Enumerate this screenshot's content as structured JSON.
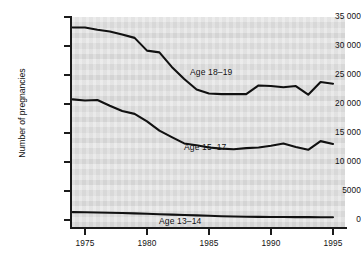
{
  "chart_data": {
    "type": "line",
    "title": "",
    "xlabel": "",
    "ylabel": "Number of pregnancies",
    "xlim": [
      1974,
      1996
    ],
    "ylim": [
      0,
      35000
    ],
    "grid": false,
    "legend_position": "inline-labels",
    "x_ticks": [
      "1975",
      "1980",
      "1985",
      "1990",
      "1995"
    ],
    "x_tick_values": [
      1975,
      1980,
      1985,
      1990,
      1995
    ],
    "y_ticks": [
      "0",
      "5000",
      "10 000",
      "15 000",
      "20 000",
      "25 000",
      "30 000",
      "35 000"
    ],
    "y_tick_values": [
      0,
      5000,
      10000,
      15000,
      20000,
      25000,
      30000,
      35000
    ],
    "x": [
      1974,
      1975,
      1976,
      1977,
      1978,
      1979,
      1980,
      1981,
      1982,
      1983,
      1984,
      1985,
      1986,
      1987,
      1988,
      1989,
      1990,
      1991,
      1992,
      1993,
      1994,
      1995
    ],
    "series": [
      {
        "name": "Age 18-19",
        "label": "Age 18–19",
        "color": "#111111",
        "values": [
          33200,
          33200,
          32800,
          32500,
          32000,
          31400,
          29200,
          28900,
          26400,
          24300,
          22500,
          21800,
          21700,
          21700,
          21700,
          23200,
          23100,
          22900,
          23100,
          21600,
          23800,
          23500
        ]
      },
      {
        "name": "Age 15-17",
        "label": "Age 15–17",
        "color": "#111111",
        "values": [
          20800,
          20600,
          20700,
          19700,
          18800,
          18300,
          17000,
          15400,
          14300,
          13200,
          12900,
          12500,
          12300,
          12200,
          12400,
          12500,
          12800,
          13200,
          12600,
          12100,
          13600,
          13100
        ]
      },
      {
        "name": "Age 13-14",
        "label": "Age 13–14",
        "color": "#111111",
        "values": [
          1350,
          1330,
          1300,
          1250,
          1200,
          1150,
          1080,
          1000,
          930,
          860,
          790,
          720,
          650,
          600,
          570,
          545,
          525,
          510,
          500,
          490,
          480,
          470
        ]
      }
    ],
    "series_label_positions": [
      {
        "label": "Age 18–19",
        "x_px": 190,
        "y_px": 67
      },
      {
        "label": "Age 15–17",
        "x_px": 184,
        "y_px": 142
      },
      {
        "label": "Age 13–14",
        "x_px": 159,
        "y_px": 216
      }
    ]
  }
}
